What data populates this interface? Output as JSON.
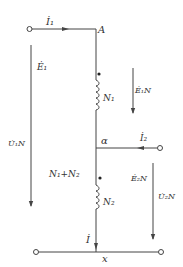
{
  "diagram": {
    "type": "autotransformer-circuit",
    "colors": {
      "line": "#444444",
      "text": "#333333",
      "background": "#ffffff"
    },
    "nodes": {
      "top": "A",
      "tap": "α",
      "bottom": "x"
    },
    "currents": {
      "primary": "İ₁",
      "secondary": "İ₂",
      "common": "İ"
    },
    "windings": {
      "upper": "N₁",
      "lower": "N₂",
      "total": "N₁+N₂"
    },
    "emfs": {
      "e1": "Ė₁",
      "e1n": "Ė₁N",
      "e2n": "Ė₂N"
    },
    "voltages": {
      "u1n": "U̇₁N",
      "u2n": "U̇₂N"
    }
  }
}
